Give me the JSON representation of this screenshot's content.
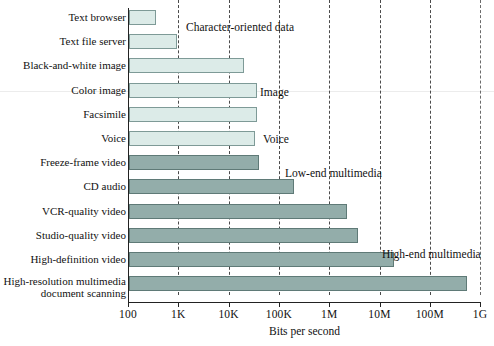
{
  "chart_data": {
    "type": "bar",
    "orientation": "horizontal",
    "title": "",
    "xlabel": "Bits per second",
    "ylabel": "",
    "xscale": "log",
    "xlim": [
      100,
      1000000000
    ],
    "grid": true,
    "legend_position": "none",
    "tick_labels": [
      "100",
      "1K",
      "10K",
      "100K",
      "1M",
      "10M",
      "100M",
      "1G"
    ],
    "tick_values": [
      100,
      1000,
      10000,
      100000,
      1000000,
      10000000,
      100000000,
      1000000000
    ],
    "categories": [
      "Text browser",
      "Text file server",
      "Black-and-white image",
      "Color image",
      "Facsimile",
      "Voice",
      "Freeze-frame video",
      "CD audio",
      "VCR-quality video",
      "Studio-quality video",
      "High-definition video",
      "High-resolution multimedia document scanning"
    ],
    "values": [
      300,
      1000,
      200000,
      400000,
      400000,
      350000,
      450000,
      1400000,
      15000000,
      25000000,
      170000000,
      600000000
    ],
    "annotations": [
      "Character-oriented data",
      "Image",
      "Voice",
      "Low-end multimedia",
      "High-end multimedia"
    ]
  },
  "axis": {
    "x_title": "Bits per second",
    "ticks": [
      {
        "label": "100",
        "pos": 0
      },
      {
        "label": "1K",
        "pos": 1
      },
      {
        "label": "10K",
        "pos": 2
      },
      {
        "label": "100K",
        "pos": 3
      },
      {
        "label": "1M",
        "pos": 4
      },
      {
        "label": "10M",
        "pos": 5
      },
      {
        "label": "100M",
        "pos": 6
      },
      {
        "label": "1G",
        "pos": 7
      }
    ]
  },
  "rows": [
    {
      "label": "Text browser",
      "label2": "",
      "end": 155,
      "shade": "light"
    },
    {
      "label": "Text file server",
      "label2": "",
      "end": 176,
      "shade": "light"
    },
    {
      "label": "Black-and-white image",
      "label2": "",
      "end": 243,
      "shade": "light"
    },
    {
      "label": "Color image",
      "label2": "",
      "end": 256,
      "shade": "light"
    },
    {
      "label": "Facsimile",
      "label2": "",
      "end": 256,
      "shade": "light"
    },
    {
      "label": "Voice",
      "label2": "",
      "end": 254,
      "shade": "light"
    },
    {
      "label": "Freeze-frame video",
      "label2": "",
      "end": 258,
      "shade": "dark"
    },
    {
      "label": "CD audio",
      "label2": "",
      "end": 293,
      "shade": "dark"
    },
    {
      "label": "VCR-quality video",
      "label2": "",
      "end": 346,
      "shade": "dark"
    },
    {
      "label": "Studio-quality video",
      "label2": "",
      "end": 357,
      "shade": "dark"
    },
    {
      "label": "High-definition video",
      "label2": "",
      "end": 393,
      "shade": "dark"
    },
    {
      "label": "High-resolution multimedia",
      "label2": "document scanning",
      "end": 466,
      "shade": "dark"
    }
  ],
  "annotations": [
    {
      "text": "Character-oriented data",
      "x": 186,
      "y": 21
    },
    {
      "text": "Image",
      "x": 260,
      "y": 86
    },
    {
      "text": "Voice",
      "x": 263,
      "y": 133
    },
    {
      "text": "Low-end multimedia",
      "x": 285,
      "y": 167
    },
    {
      "text": "High-end multimedia",
      "x": 382,
      "y": 248
    }
  ],
  "colors": {
    "bar_light": "#dcebe8",
    "bar_dark": "#93adaa",
    "axis": "#222222",
    "grid": "#4a4a4a",
    "text": "#111111",
    "background": "#ffffff"
  }
}
